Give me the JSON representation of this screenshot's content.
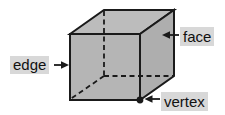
{
  "diagram": {
    "name": "cube-parts-diagram",
    "shape": "cube",
    "labels": {
      "edge": "edge",
      "face": "face",
      "vertex": "vertex"
    },
    "colors": {
      "background": "#ffffff",
      "face_top": "#bcbcbc",
      "face_right": "#aeaeae",
      "face_front": "#b5b5b5",
      "label_bg": "#d8d8d8",
      "line": "#1a1a1a",
      "text": "#111111"
    }
  }
}
